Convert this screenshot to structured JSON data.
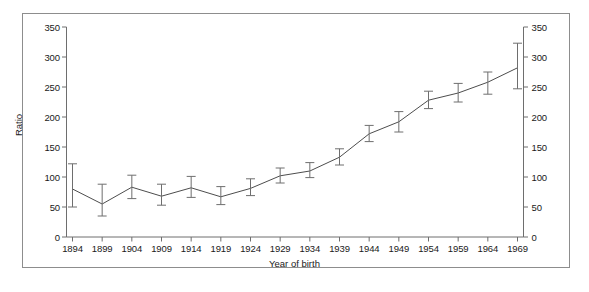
{
  "chart_data": {
    "type": "line",
    "title": "",
    "xlabel": "Year of birth",
    "ylabel": "Ratio",
    "ylabel_right": "Ratio",
    "xlim": [
      1891.5,
      1971.5
    ],
    "ylim": [
      0,
      350
    ],
    "grid": false,
    "legend": null,
    "yticks": [
      0,
      50,
      100,
      150,
      200,
      250,
      300,
      350
    ],
    "yticks_right": [
      0,
      50,
      100,
      150,
      200,
      250,
      300,
      350
    ],
    "xticks": [
      1894,
      1899,
      1904,
      1909,
      1914,
      1919,
      1924,
      1929,
      1934,
      1939,
      1944,
      1949,
      1954,
      1959,
      1964,
      1969
    ],
    "categories": [
      "1894",
      "1899",
      "1904",
      "1909",
      "1914",
      "1919",
      "1924",
      "1929",
      "1934",
      "1939",
      "1944",
      "1949",
      "1954",
      "1959",
      "1964",
      "1969"
    ],
    "x": [
      1894,
      1899,
      1904,
      1909,
      1914,
      1919,
      1924,
      1929,
      1934,
      1939,
      1944,
      1949,
      1954,
      1959,
      1964,
      1969
    ],
    "values": [
      80,
      55,
      83,
      68,
      82,
      67,
      81,
      102,
      110,
      133,
      172,
      192,
      228,
      240,
      258,
      282
    ],
    "error_low": [
      50,
      35,
      64,
      53,
      66,
      54,
      69,
      90,
      99,
      120,
      159,
      175,
      214,
      225,
      238,
      247
    ],
    "error_high": [
      122,
      88,
      103,
      88,
      101,
      84,
      97,
      115,
      124,
      147,
      186,
      209,
      243,
      256,
      275,
      323
    ],
    "series": [
      {
        "name": "Ratio",
        "values": [
          80,
          55,
          83,
          68,
          82,
          67,
          81,
          102,
          110,
          133,
          172,
          192,
          228,
          240,
          258,
          282
        ],
        "error_low": [
          50,
          35,
          64,
          53,
          66,
          54,
          69,
          90,
          99,
          120,
          159,
          175,
          214,
          225,
          238,
          247
        ],
        "error_high": [
          122,
          88,
          103,
          88,
          101,
          84,
          97,
          115,
          124,
          147,
          186,
          209,
          243,
          256,
          275,
          323
        ],
        "color": "#4d4d4d",
        "marker": "none",
        "errorbar": "capped"
      }
    ],
    "colors": {
      "line": "#4d4d4d",
      "axis": "#6e6e6e",
      "errorbar": "#6e6e6e",
      "frame": "#8d8d8d",
      "text": "#1a1a1a",
      "background": "#ffffff"
    }
  }
}
